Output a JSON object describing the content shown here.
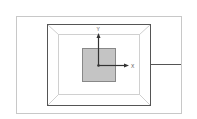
{
  "diagram": {
    "type": "3d-room-viewport-with-axes",
    "axes": {
      "x_label": "X",
      "y_label": "Y"
    },
    "colors": {
      "outer_frame": "#c8c8c8",
      "room_outline": "#555555",
      "room_inner": "#d0d0d0",
      "square_fill": "#c4c4c4",
      "square_stroke": "#888888",
      "axis": "#333333",
      "connector": "#555555"
    }
  }
}
